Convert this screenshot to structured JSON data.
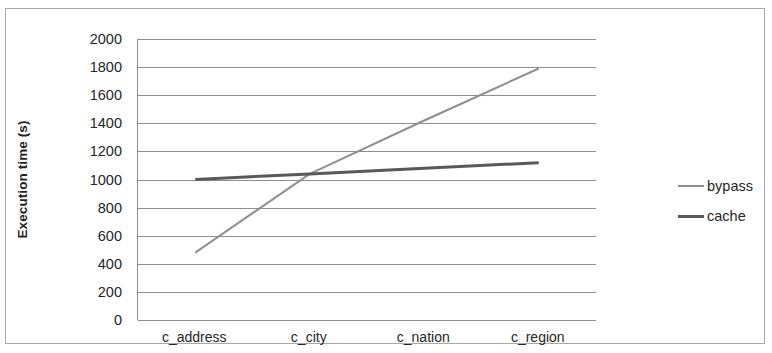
{
  "chart_data": {
    "type": "line",
    "title": "",
    "xlabel": "",
    "ylabel": "Execution time (s)",
    "categories": [
      "c_address",
      "c_city",
      "c_nation",
      "c_region"
    ],
    "series": [
      {
        "name": "bypass",
        "values": [
          480,
          1040,
          1420,
          1790
        ],
        "color": "#8f8f8f",
        "width": 2
      },
      {
        "name": "cache",
        "values": [
          1000,
          1040,
          1080,
          1120
        ],
        "color": "#595959",
        "width": 3
      }
    ],
    "ylim": [
      0,
      2000
    ],
    "ytick_step": 200,
    "yticks": [
      2000,
      1800,
      1600,
      1400,
      1200,
      1000,
      800,
      600,
      400,
      200,
      0
    ],
    "grid": true,
    "grid_axis": "y",
    "legend_position": "right",
    "plot_background": "#ffffff",
    "grid_color": "#8e8e8e",
    "axis_color": "#8d8d8d",
    "frame_color": "#a8a8a8"
  },
  "legend": {
    "entries": [
      {
        "label": "bypass"
      },
      {
        "label": "cache"
      }
    ]
  }
}
